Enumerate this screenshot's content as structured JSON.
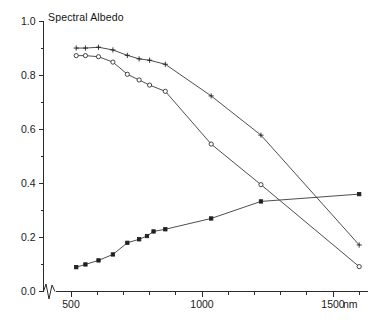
{
  "chart_data": {
    "type": "line",
    "title": "Spectral Albedo",
    "xlabel": "nm",
    "ylabel": "",
    "xlim": [
      430,
      1620
    ],
    "ylim": [
      0.0,
      1.0
    ],
    "grid": false,
    "legend": "none",
    "axis_break": "x-axis broken between origin and 430 nm",
    "x_ticks_major": [
      500,
      1000,
      1500
    ],
    "x_tick_labels": [
      "500",
      "1000",
      "1500"
    ],
    "x_ticks_minor": [
      600,
      700,
      800,
      900,
      1100,
      1200,
      1300,
      1400,
      1600
    ],
    "x_unit": "nm",
    "y_ticks_major": [
      0.0,
      0.2,
      0.4,
      0.6,
      0.8,
      1.0
    ],
    "y_tick_labels": [
      "0.0",
      "0.2",
      "0.4",
      "0.6",
      "0.8",
      "1.0"
    ],
    "y_ticks_minor": [
      0.1,
      0.3,
      0.5,
      0.7,
      0.9
    ],
    "series": [
      {
        "name": "upper-curve-plus",
        "marker": "plus",
        "x": [
          520,
          555,
          605,
          660,
          715,
          760,
          800,
          860,
          1035,
          1225,
          1600
        ],
        "values": [
          0.9,
          0.9,
          0.903,
          0.893,
          0.873,
          0.86,
          0.855,
          0.84,
          0.723,
          0.578,
          0.172
        ]
      },
      {
        "name": "middle-curve-open-circle",
        "marker": "open-circle",
        "x": [
          520,
          555,
          605,
          660,
          715,
          760,
          800,
          860,
          1035,
          1225,
          1600
        ],
        "values": [
          0.872,
          0.872,
          0.868,
          0.848,
          0.803,
          0.782,
          0.763,
          0.74,
          0.545,
          0.395,
          0.092
        ]
      },
      {
        "name": "lower-curve-ascending-square",
        "marker": "filled-square",
        "x": [
          520,
          555,
          605,
          660,
          715,
          760,
          790,
          815,
          860,
          1035,
          1225,
          1600
        ],
        "values": [
          0.09,
          0.1,
          0.115,
          0.137,
          0.18,
          0.193,
          0.205,
          0.222,
          0.23,
          0.27,
          0.333,
          0.36
        ]
      }
    ]
  },
  "figure": {
    "title": "Spectral Albedo"
  }
}
